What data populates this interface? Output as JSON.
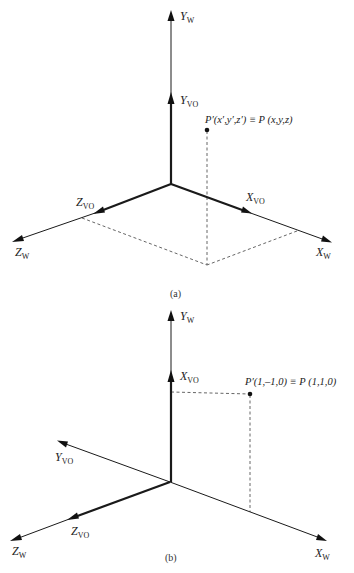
{
  "figure_a": {
    "caption": "(a)",
    "labels": {
      "y_w": "Y",
      "y_w_sub": "W",
      "y_vo": "Y",
      "y_vo_sub": "VO",
      "z_vo": "Z",
      "z_vo_sub": "VO",
      "z_w": "Z",
      "z_w_sub": "W",
      "x_vo": "X",
      "x_vo_sub": "VO",
      "x_w": "X",
      "x_w_sub": "W"
    },
    "point_label": "P′(x′,y′,z′) ≡ P (x,y,z)"
  },
  "figure_b": {
    "caption": "(b)",
    "labels": {
      "y_w": "Y",
      "y_w_sub": "W",
      "x_vo": "X",
      "x_vo_sub": "VO",
      "y_vo": "Y",
      "y_vo_sub": "VO",
      "z_vo": "Z",
      "z_vo_sub": "VO",
      "z_w": "Z",
      "z_w_sub": "W",
      "x_w": "X",
      "x_w_sub": "W"
    },
    "point_label": "P′(1,–1,0) ≡ P (1,1,0)"
  }
}
